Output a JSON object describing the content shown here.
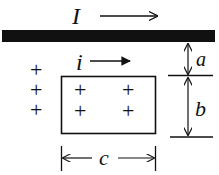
{
  "diagram": {
    "wire_current_label": "I",
    "loop_current_label": "i",
    "dimension_a_label": "a",
    "dimension_b_label": "b",
    "dimension_c_label": "c",
    "field_symbol": "+",
    "colors": {
      "ink": "#111111",
      "background": "#ffffff"
    }
  }
}
